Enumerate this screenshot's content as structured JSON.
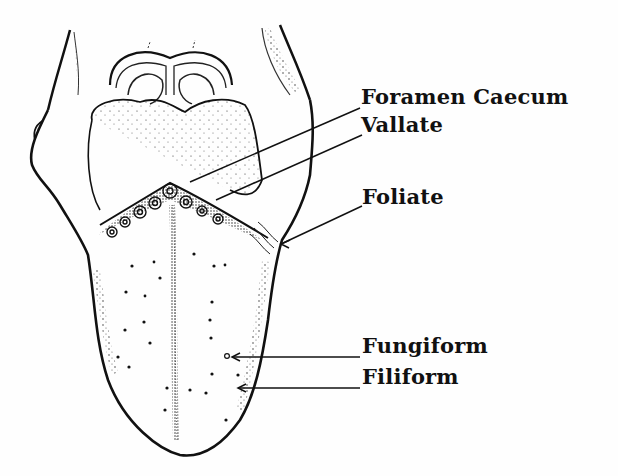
{
  "figure": {
    "labels": [
      {
        "id": "foramen-caecum",
        "text": "Foramen Caecum"
      },
      {
        "id": "vallate",
        "text": "Vallate"
      },
      {
        "id": "foliate",
        "text": "Foliate"
      },
      {
        "id": "fungiform",
        "text": "Fungiform"
      },
      {
        "id": "filiform",
        "text": "Filiform"
      }
    ],
    "colors": {
      "ink": "#111111",
      "paper": "#fefefe",
      "bleed": "#ececec"
    }
  }
}
